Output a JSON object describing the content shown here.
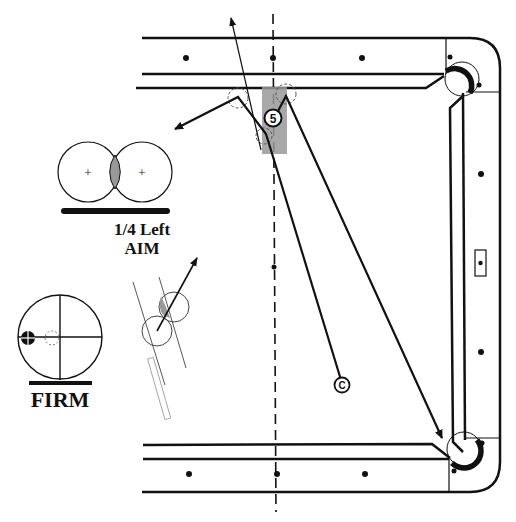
{
  "diagram": {
    "type": "billiards-shot-diagram",
    "object_ball": {
      "label": "5"
    },
    "cue_ball": {
      "label": "C"
    },
    "aim_panel": {
      "line1": "1/4 Left",
      "line2": "AIM"
    },
    "stroke_panel": {
      "label": "FIRM"
    },
    "colors": {
      "ink": "#111111",
      "shade": "#999999",
      "light_shade": "#bbbbbb",
      "background": "#ffffff"
    }
  }
}
